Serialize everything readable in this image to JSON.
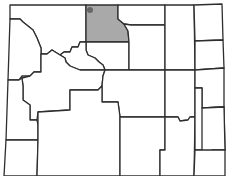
{
  "map": {
    "region": "Wyoming",
    "highlighted_county": "Big Horn",
    "highlight_color": "#a9a9a9",
    "marker_color": "#666666",
    "border_color": "#2e2e2e",
    "background_color": "#ffffff"
  }
}
